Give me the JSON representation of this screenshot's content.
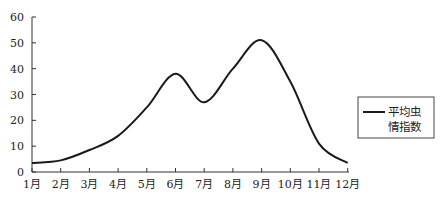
{
  "chart_data": {
    "type": "line",
    "title": "",
    "xlabel": "",
    "ylabel": "",
    "categories": [
      "1月",
      "2月",
      "3月",
      "4月",
      "5月",
      "6月",
      "7月",
      "8月",
      "9月",
      "10月",
      "11月",
      "12月"
    ],
    "series": [
      {
        "name": "平均虫情指数",
        "values": [
          3.5,
          4.5,
          8.5,
          14,
          25,
          38,
          27,
          40,
          51,
          35,
          11,
          3.5
        ],
        "color": "#1a1a1a"
      }
    ],
    "ylim": [
      0,
      60
    ],
    "yticks": [
      0,
      10,
      20,
      30,
      40,
      50,
      60
    ],
    "grid": false,
    "legend_position": "right",
    "legend": {
      "line1": "平均虫",
      "line2": "情指数"
    }
  }
}
